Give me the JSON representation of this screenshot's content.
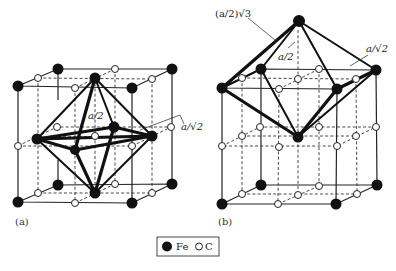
{
  "figure": {
    "panels": [
      {
        "id": "a",
        "label": "(a)",
        "annotations": {
          "half_a": "a/2",
          "a_over_root2": "a/√2"
        }
      },
      {
        "id": "b",
        "label": "(b)",
        "annotations": {
          "half_a_root3": "(a/2)√3",
          "half_a": "a/2",
          "a_over_root2": "a/√2"
        }
      }
    ],
    "legend": {
      "items": [
        {
          "symbol": "filled-circle",
          "label": "Fe",
          "color": "#111111"
        },
        {
          "symbol": "open-circle",
          "label": "C",
          "color": "#ffffff"
        }
      ]
    }
  }
}
